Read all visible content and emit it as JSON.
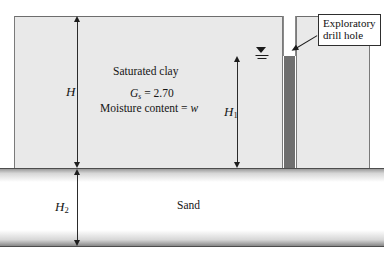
{
  "figure": {
    "type": "soil-profile-cross-section",
    "layers": [
      {
        "id": "clay",
        "label": "Saturated clay",
        "fill": "#e9e9e9",
        "stipple": true
      },
      {
        "id": "sand",
        "label": "Sand",
        "fill": "#ffffff",
        "stipple": false
      }
    ],
    "clay_properties": {
      "specific_gravity_symbol": "G",
      "specific_gravity_subscript": "s",
      "specific_gravity_equals": " = 2.70",
      "moisture_text": "Moisture content = ",
      "moisture_symbol": "w"
    },
    "dimensions": [
      {
        "id": "H",
        "symbol": "H",
        "subscript": "",
        "measures": "full clay layer thickness"
      },
      {
        "id": "H1",
        "symbol": "H",
        "subscript": "1",
        "measures": "clay below water table"
      },
      {
        "id": "H2",
        "symbol": "H",
        "subscript": "2",
        "measures": "sand layer thickness"
      }
    ],
    "drill_hole": {
      "callout_line1": "Exploratory",
      "callout_line2": "drill hole",
      "air_fill": "#ffffff",
      "water_fill": "#6f6f6f"
    },
    "water_table": {
      "symbol_name": "water-table-triangle",
      "description": "inverted triangle with two horizontal bars"
    },
    "colors": {
      "clay_fill": "#e9e9e9",
      "sand_fill": "#ffffff",
      "hole_water": "#6f6f6f",
      "ink": "#1b1b1b",
      "edge": "#6d6d6d"
    }
  }
}
